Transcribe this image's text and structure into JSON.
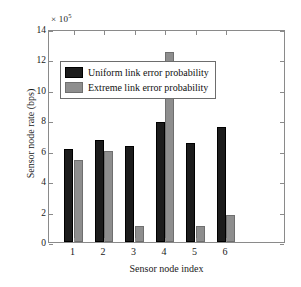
{
  "chart_data": {
    "type": "bar",
    "title": "",
    "xlabel": "Sensor node index",
    "ylabel": "Sensor node rate (bps)",
    "y_multiplier": "× 10",
    "y_multiplier_exponent": "5",
    "categories": [
      "1",
      "2",
      "3",
      "4",
      "5",
      "6"
    ],
    "ylim": [
      0,
      14
    ],
    "yticks": [
      0,
      2,
      4,
      6,
      8,
      10,
      12,
      14
    ],
    "ytick_labels": [
      "0",
      "2",
      "4",
      "6",
      "8",
      "10",
      "12",
      "14"
    ],
    "grid": false,
    "legend_position": "upper-left-inside",
    "series": [
      {
        "name": "Uniform link error probability",
        "color": "#1c1c1c",
        "values": [
          6.1,
          6.7,
          6.3,
          7.9,
          6.5,
          7.55
        ]
      },
      {
        "name": "Extreme link error probability",
        "color": "#8e8e8e",
        "values": [
          5.4,
          5.95,
          1.05,
          12.5,
          1.05,
          1.78
        ]
      }
    ]
  },
  "legend": {
    "items": [
      {
        "label": "Uniform link error probability",
        "swatch": "black-swatch"
      },
      {
        "label": "Extreme link error probability",
        "swatch": "gray-swatch"
      }
    ]
  }
}
